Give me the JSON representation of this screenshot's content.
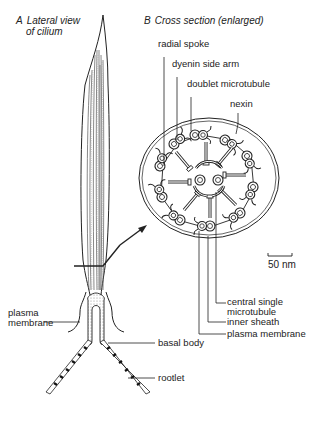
{
  "panel_a": {
    "letter": "A",
    "title_line1": "Lateral view",
    "title_line2": "of cilium"
  },
  "panel_b": {
    "letter": "B",
    "title": "Cross section (enlarged)"
  },
  "labels": {
    "radial_spoke": "radial spoke",
    "dyenin_side_arm": "dyenin side arm",
    "doublet_microtubule": "doublet microtubule",
    "nexin": "nexin",
    "scale_bar": "50 nm",
    "central_single_line1": "central single",
    "central_single_line2": "microtubule",
    "inner_sheath": "inner sheath",
    "plasma_membrane_b": "plasma membrane",
    "plasma_membrane_a_line1": "plasma",
    "plasma_membrane_a_line2": "membrane",
    "basal_body": "basal body",
    "rootlet": "rootlet"
  },
  "colors": {
    "ink": "#222222",
    "background": "#ffffff",
    "stipple": "#888888"
  }
}
